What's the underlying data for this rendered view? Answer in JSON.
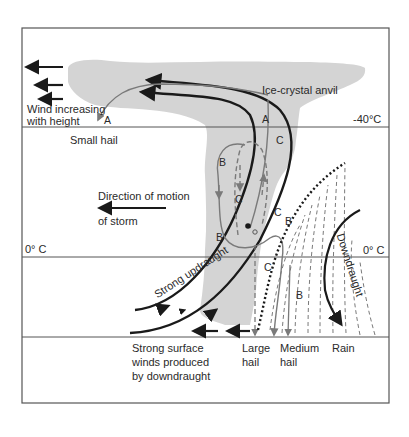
{
  "labels": {
    "ice_crystal_anvil": "Ice-crystal anvil",
    "wind_increasing_1": "Wind increasing",
    "wind_increasing_2": "with height",
    "small_hail": "Small hail",
    "direction_1": "Direction of motion",
    "direction_2": "of storm",
    "temp_minus40": "-40°C",
    "temp_zero_left": "0° C",
    "temp_zero_right": "0° C",
    "strong_updraught": "Strong updraught",
    "downdraught": "Downdraught",
    "surface_winds_1": "Strong surface",
    "surface_winds_2": "winds produced",
    "surface_winds_3": "by downdraught",
    "large_hail_1": "Large",
    "large_hail_2": "hail",
    "medium_hail_1": "Medium",
    "medium_hail_2": "hail",
    "rain": "Rain"
  },
  "path_markers": {
    "A_top": "A",
    "A_left": "A",
    "B_upper": "B",
    "B_lower": "B",
    "B_right": "B",
    "B_rain": "B",
    "C_top": "C",
    "C_mid_left": "C",
    "C_mid_right": "C",
    "C_bottom": "C"
  },
  "colors": {
    "cloud": "#d4d4d4",
    "line_dark": "#1a1a1a",
    "line_grey": "#7a7a7a",
    "frame": "#555555"
  }
}
